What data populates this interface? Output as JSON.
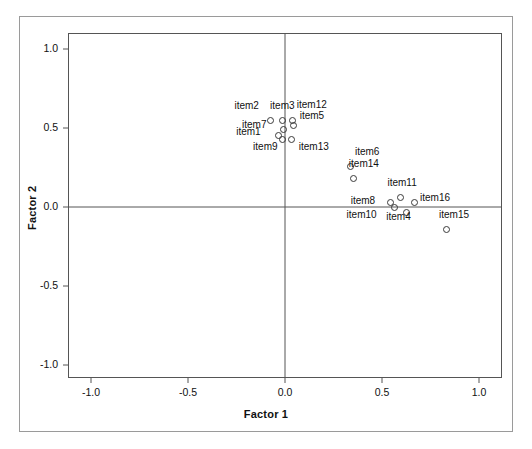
{
  "chart_data": {
    "type": "scatter",
    "title": "",
    "xlabel": "Factor 1",
    "ylabel": "Factor 2",
    "xlim": [
      -1.12,
      1.12
    ],
    "ylim": [
      -1.1,
      1.1
    ],
    "xticks": [
      "-1.0",
      "-0.5",
      "0.0",
      "0.5",
      "1.0"
    ],
    "xtick_values": [
      -1.0,
      -0.5,
      0.0,
      0.5,
      1.0
    ],
    "yticks": [
      "1.0",
      "0.5",
      "0.0",
      "-0.5",
      "-1.0"
    ],
    "ytick_values": [
      1.0,
      0.5,
      0.0,
      -0.5,
      -1.0
    ],
    "grid": false,
    "legend": "none",
    "reference_lines": [
      {
        "axis": "vertical",
        "value": 0.0
      },
      {
        "axis": "horizontal",
        "value": 0.0
      }
    ],
    "points": [
      {
        "label": "item1",
        "x": -0.035,
        "y": 0.455,
        "label_dx": -42,
        "label_dy": -4
      },
      {
        "label": "item2",
        "x": -0.075,
        "y": 0.545,
        "label_dx": -36,
        "label_dy": -16
      },
      {
        "label": "item3",
        "x": -0.015,
        "y": 0.545,
        "label_dx": -12,
        "label_dy": -16
      },
      {
        "label": "item4",
        "x": 0.625,
        "y": -0.035,
        "label_dx": -20,
        "label_dy": 3
      },
      {
        "label": "item5",
        "x": 0.045,
        "y": 0.515,
        "label_dx": 6,
        "label_dy": -11
      },
      {
        "label": "item6",
        "x": 0.34,
        "y": 0.255,
        "label_dx": 4,
        "label_dy": -16
      },
      {
        "label": "item7",
        "x": -0.01,
        "y": 0.49,
        "label_dx": -41,
        "label_dy": -6
      },
      {
        "label": "item8",
        "x": 0.545,
        "y": 0.03,
        "label_dx": -40,
        "label_dy": -2
      },
      {
        "label": "item9",
        "x": -0.015,
        "y": 0.425,
        "label_dx": -29,
        "label_dy": 6
      },
      {
        "label": "item10",
        "x": 0.565,
        "y": 0.0,
        "label_dx": -48,
        "label_dy": 7
      },
      {
        "label": "item11",
        "x": 0.595,
        "y": 0.06,
        "label_dx": -13,
        "label_dy": -16
      },
      {
        "label": "item12",
        "x": 0.04,
        "y": 0.545,
        "label_dx": 4,
        "label_dy": -17
      },
      {
        "label": "item13",
        "x": 0.035,
        "y": 0.425,
        "label_dx": 7,
        "label_dy": 6
      },
      {
        "label": "item14",
        "x": 0.355,
        "y": 0.18,
        "label_dx": -5,
        "label_dy": -16
      },
      {
        "label": "item15",
        "x": 0.835,
        "y": -0.145,
        "label_dx": -8,
        "label_dy": -16
      },
      {
        "label": "item16",
        "x": 0.665,
        "y": 0.03,
        "label_dx": 6,
        "label_dy": -5
      }
    ]
  },
  "labels": {
    "xaxis": "Factor 1",
    "yaxis": "Factor 2"
  }
}
